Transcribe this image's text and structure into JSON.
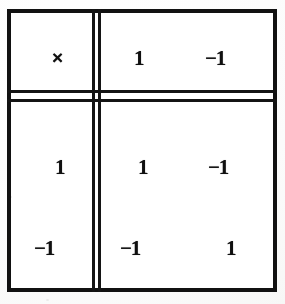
{
  "document": {
    "type": "multiplication-table",
    "caption": "Multiplication table for the set {1, -1}"
  },
  "table": {
    "corner_label": "×",
    "corner_icon_name": "multiplication-sign",
    "column_headers": [
      "1",
      "−1"
    ],
    "row_headers": [
      "1",
      "−1"
    ],
    "rows": [
      {
        "header": "1",
        "cells": [
          "1",
          "−1"
        ]
      },
      {
        "header": "−1",
        "cells": [
          "−1",
          "1"
        ]
      }
    ]
  },
  "colors": {
    "ink": "#101010",
    "rule": "#141414",
    "paper": "#ffffff"
  }
}
